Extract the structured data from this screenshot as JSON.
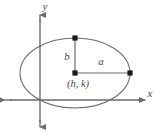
{
  "figure": {
    "kind": "ellipse-diagram",
    "width": 160,
    "height": 137,
    "background_color": "#ffffff",
    "stroke_color": "#6b6b6b",
    "label_color": "#4a4a4a"
  },
  "axes": {
    "x_label": "x",
    "y_label": "y",
    "x_axis": {
      "y": 100,
      "x_start": 5,
      "x_end": 145,
      "arrows": "both"
    },
    "y_axis": {
      "x": 40,
      "y_start": 15,
      "y_end": 127,
      "arrows": "both"
    },
    "origin": {
      "x": 40,
      "y": 100
    }
  },
  "ellipse": {
    "center_x": 75,
    "center_y": 73,
    "semi_major_a": 55,
    "semi_minor_b": 35,
    "stroke_color": "#6b6b6b",
    "stroke_width": 1.1,
    "fill": "none"
  },
  "labels": {
    "center_point": "(h, k)",
    "semi_major": "a",
    "semi_minor": "b"
  },
  "points": [
    {
      "name": "center",
      "x": 75,
      "y": 73
    },
    {
      "name": "right-covertex",
      "x": 130,
      "y": 73
    },
    {
      "name": "top-covertex",
      "x": 75,
      "y": 38
    }
  ],
  "segments": [
    {
      "name": "semi-major-segment",
      "x1": 75,
      "y1": 73,
      "x2": 130,
      "y2": 73,
      "label": "a"
    },
    {
      "name": "semi-minor-segment",
      "x1": 75,
      "y1": 38,
      "x2": 75,
      "y2": 73,
      "label": "b"
    }
  ]
}
